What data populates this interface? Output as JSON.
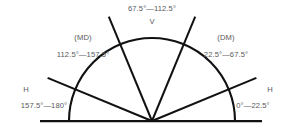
{
  "diagram": {
    "type": "angle-sector-semicircle",
    "stroke_color": "#111111",
    "text_color": "#58585a",
    "background": "#ffffff",
    "geometry": {
      "vertex_x": 152,
      "vertex_y": 121,
      "arc_radius": 83,
      "ray_radius": 113,
      "baseline_x_start": 40,
      "baseline_x_end": 262,
      "ray_angles_deg": [
        22.5,
        67.5,
        112.5,
        157.5
      ]
    },
    "sectors": [
      {
        "code": "H",
        "range": "0°—22.5°",
        "from": 0,
        "to": 22.5
      },
      {
        "code": "(DM)",
        "range": "22.5°—67.5°",
        "from": 22.5,
        "to": 67.5
      },
      {
        "code": "V",
        "range": "67.5°—112.5°",
        "from": 67.5,
        "to": 112.5
      },
      {
        "code": "(MD)",
        "range": "112.5°—157.5°",
        "from": 112.5,
        "to": 157.5
      },
      {
        "code": "H",
        "range": "157.5°—180°",
        "from": 157.5,
        "to": 180
      }
    ],
    "labels": {
      "v_range": "67.5°—112.5°",
      "v_code": "V",
      "md_code": "(MD)",
      "md_range": "112.5°—157.5°",
      "dm_code": "(DM)",
      "dm_range": "22.5°—67.5°",
      "h_left_code": "H",
      "h_left_range": "157.5°—180°",
      "h_right_code": "H",
      "h_right_range": "0°—22.5°"
    }
  }
}
